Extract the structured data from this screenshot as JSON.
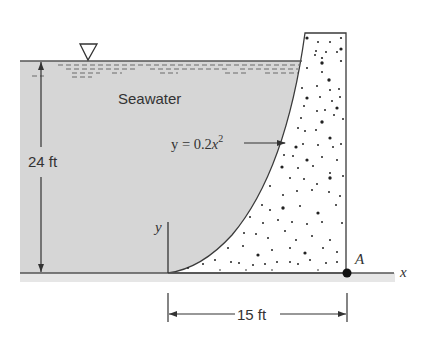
{
  "diagram": {
    "fluid_label": "Seawater",
    "curve_equation_prefix": "y = 0.2",
    "curve_equation_var": "x",
    "curve_equation_exp": "2",
    "depth_label": "24 ft",
    "width_label": "15 ft",
    "axis_y_label": "y",
    "axis_x_label": "x",
    "point_label": "A",
    "colors": {
      "water": "#d6d6d6",
      "ground": "#e4e4e4",
      "line": "#3a3a3a",
      "concrete": "#ffffff",
      "dots": "#222222"
    }
  }
}
